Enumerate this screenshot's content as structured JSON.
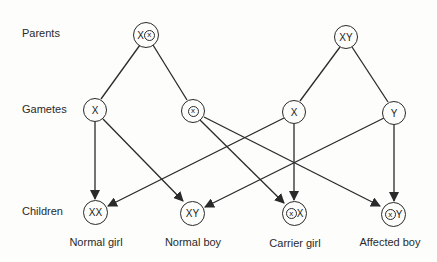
{
  "row_labels": {
    "parents": "Parents",
    "gametes": "Gametes",
    "children": "Children"
  },
  "parents": {
    "mother": {
      "allele1": "X",
      "allele2_mutant": "x"
    },
    "father": {
      "genotype": "XY"
    }
  },
  "gametes": {
    "mother_normal": "X",
    "mother_mutant": "x",
    "father_x": "X",
    "father_y": "Y"
  },
  "children": [
    {
      "genotype": "XX",
      "label": "Normal girl"
    },
    {
      "genotype": "XY",
      "label": "Normal boy"
    },
    {
      "mutant": "x",
      "other": "X",
      "label": "Carrier girl"
    },
    {
      "mutant": "x",
      "other": "Y",
      "label": "Affected boy"
    }
  ],
  "colors": {
    "line": "#2a2a2a",
    "background": "#fdfdfb"
  }
}
